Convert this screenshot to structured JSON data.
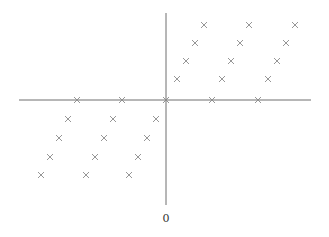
{
  "diagram": {
    "origin_label": "0",
    "colors": {
      "axis": "#6e6e6e",
      "marker": "#8a8a8a",
      "label": "#333333",
      "background": "#ffffff"
    },
    "axes": {
      "horizontal": {
        "x1": 19,
        "y1": 100,
        "x2": 311,
        "y2": 100
      },
      "vertical": {
        "x1": 166,
        "y1": 13,
        "x2": 166,
        "y2": 205
      }
    },
    "origin_label_pos": {
      "x": 166,
      "y": 222
    },
    "marker_glyph": "x",
    "marker_half_size": 3,
    "points": [
      {
        "x": 204,
        "y": 25
      },
      {
        "x": 249,
        "y": 25
      },
      {
        "x": 295,
        "y": 25
      },
      {
        "x": 195,
        "y": 43
      },
      {
        "x": 240,
        "y": 43
      },
      {
        "x": 286,
        "y": 43
      },
      {
        "x": 186,
        "y": 61
      },
      {
        "x": 231,
        "y": 61
      },
      {
        "x": 277,
        "y": 61
      },
      {
        "x": 177,
        "y": 79
      },
      {
        "x": 222,
        "y": 79
      },
      {
        "x": 268,
        "y": 79
      },
      {
        "x": 77,
        "y": 100
      },
      {
        "x": 122,
        "y": 100
      },
      {
        "x": 166,
        "y": 100
      },
      {
        "x": 212,
        "y": 100
      },
      {
        "x": 258,
        "y": 100
      },
      {
        "x": 68,
        "y": 119
      },
      {
        "x": 113,
        "y": 119
      },
      {
        "x": 156,
        "y": 119
      },
      {
        "x": 59,
        "y": 138
      },
      {
        "x": 104,
        "y": 138
      },
      {
        "x": 147,
        "y": 138
      },
      {
        "x": 50,
        "y": 157
      },
      {
        "x": 95,
        "y": 157
      },
      {
        "x": 138,
        "y": 157
      },
      {
        "x": 41,
        "y": 175
      },
      {
        "x": 86,
        "y": 175
      },
      {
        "x": 129,
        "y": 175
      }
    ]
  }
}
